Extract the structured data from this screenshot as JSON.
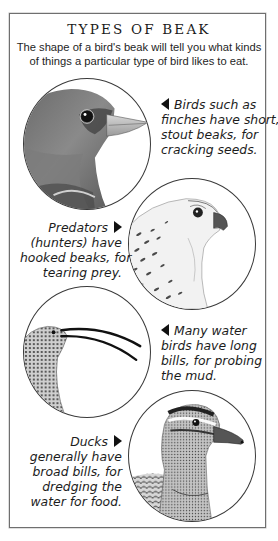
{
  "page": {
    "title": "TYPES OF BEAK",
    "intro": "The shape of a bird's beak will tell you what kinds of things a particular type of bird likes to eat."
  },
  "sections": [
    {
      "bird": "finch",
      "illustration": "finch-head-illustration",
      "arrow": "pointer-left-icon",
      "lines": [
        "Birds such as",
        "finches have short,",
        "stout beaks, for",
        "cracking seeds."
      ]
    },
    {
      "bird": "falcon",
      "illustration": "falcon-head-illustration",
      "arrow": "pointer-right-icon",
      "lines": [
        "Predators",
        "(hunters) have",
        "hooked beaks, for",
        "tearing prey."
      ]
    },
    {
      "bird": "curlew",
      "illustration": "curlew-head-illustration",
      "arrow": "pointer-left-icon",
      "lines": [
        "Many water",
        "birds have long",
        "bills, for probing",
        "the mud."
      ]
    },
    {
      "bird": "duck",
      "illustration": "duck-head-illustration",
      "arrow": "pointer-right-icon",
      "lines": [
        "Ducks",
        "generally have",
        "broad bills, for",
        "dredging the",
        "water for food."
      ]
    }
  ],
  "colors": {
    "border": "#6f6f6f",
    "text": "#1c1c1c",
    "arrow": "#111111"
  }
}
